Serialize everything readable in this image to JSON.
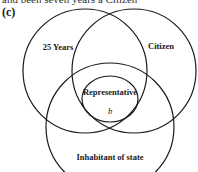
{
  "header": {
    "truncated_line": "and been seven years a Citizen",
    "panel_label": "(c)"
  },
  "diagram": {
    "type": "venn",
    "circles": [
      {
        "id": "age",
        "label": "25 Years",
        "cx": 85,
        "cy": 71,
        "r": 62
      },
      {
        "id": "citizen",
        "label": "Citizen",
        "cx": 134,
        "cy": 71,
        "r": 62
      },
      {
        "id": "inhabitant",
        "label": "Inhabitant of state",
        "cx": 110,
        "cy": 127,
        "r": 64
      },
      {
        "id": "representative",
        "label": "Representative",
        "cx": 110,
        "cy": 99,
        "rx": 28,
        "ry": 23
      }
    ],
    "inner_mark": "b",
    "stroke_color": "#1a1a1a"
  }
}
